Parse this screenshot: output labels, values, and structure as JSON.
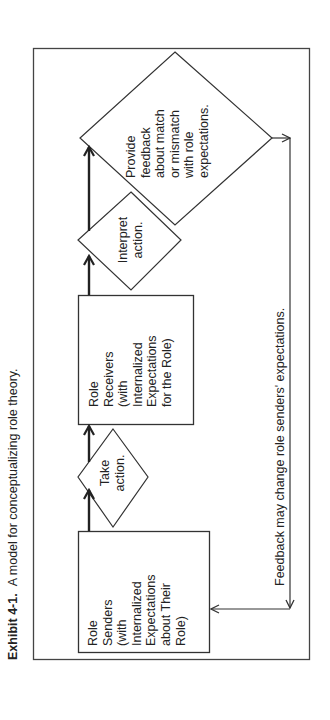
{
  "caption": {
    "label": "Exhibit 4-1.",
    "text": "A model for conceptualizing role theory."
  },
  "diagram": {
    "nodes": [
      {
        "id": "role-senders",
        "shape": "rectangle",
        "lines": [
          "Role",
          "Senders",
          "(with",
          "Internalized",
          "Expectations",
          "about Their",
          "Role)"
        ]
      },
      {
        "id": "take-action",
        "shape": "diamond",
        "lines": [
          "Take",
          "action."
        ]
      },
      {
        "id": "role-receivers",
        "shape": "rectangle",
        "lines": [
          "Role",
          "Receivers",
          "(with",
          "Internalized",
          "Expectations",
          "for the Role)"
        ]
      },
      {
        "id": "interpret-action",
        "shape": "diamond",
        "lines": [
          "Interpret",
          "action."
        ]
      },
      {
        "id": "provide-feedback",
        "shape": "diamond",
        "lines": [
          "Provide",
          "feedback",
          "about match",
          "or mismatch",
          "with role",
          "expectations."
        ]
      }
    ],
    "feedback_loop": {
      "label": "Feedback may change role senders' expectations."
    },
    "colors": {
      "stroke": "#333333",
      "background": "#ffffff",
      "text": "#222222"
    }
  }
}
